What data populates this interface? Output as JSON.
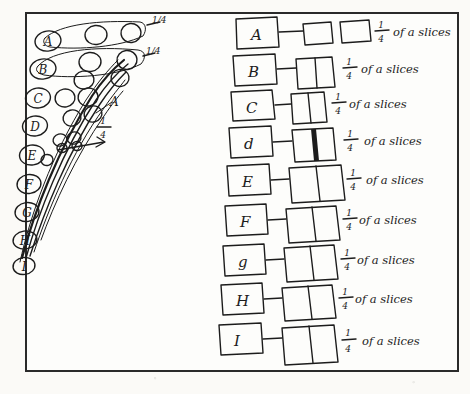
{
  "document": {
    "kind": "handwritten-worksheet-scan",
    "page_background": "#fbfaf7",
    "ink_color": "#1c1c1c",
    "frame_color": "#2a2a2a"
  },
  "left_diagram": {
    "name": "oval-chain-diagram",
    "annotations": [
      {
        "id": "top-mark-1",
        "text": "1/4"
      },
      {
        "id": "top-mark-2",
        "text": "1/4"
      },
      {
        "id": "mid-mark",
        "text": "1/4"
      },
      {
        "id": "mid-label",
        "text": "A"
      }
    ],
    "oval_labels": [
      "A",
      "B",
      "C",
      "D",
      "E",
      "F",
      "G",
      "H",
      "I"
    ]
  },
  "right_list": {
    "name": "labelled-slice-rows",
    "phrase": "of a slices",
    "rows": [
      {
        "label": "A",
        "fraction_numerator": "1",
        "fraction_denominator": "4",
        "text": "of a slices",
        "boxes": 2,
        "box_style": "separate",
        "shaded": 0
      },
      {
        "label": "B",
        "fraction_numerator": "1",
        "fraction_denominator": "4",
        "text": "of a slices",
        "boxes": 2,
        "box_style": "joined",
        "shaded": 0
      },
      {
        "label": "C",
        "fraction_numerator": "1",
        "fraction_denominator": "4",
        "text": "of a slices",
        "boxes": 2,
        "box_style": "joined",
        "shaded": 0
      },
      {
        "label": "d",
        "fraction_numerator": "1",
        "fraction_denominator": "4",
        "text": "of a slices",
        "boxes": 2,
        "box_style": "joined",
        "shaded": 1
      },
      {
        "label": "E",
        "fraction_numerator": "1",
        "fraction_denominator": "4",
        "text": "of a slices",
        "boxes": 2,
        "box_style": "joined",
        "shaded": 0
      },
      {
        "label": "F",
        "fraction_numerator": "1",
        "fraction_denominator": "4",
        "text": "of a slices",
        "boxes": 2,
        "box_style": "joined",
        "shaded": 0
      },
      {
        "label": "g",
        "fraction_numerator": "1",
        "fraction_denominator": "4",
        "text": "of a slices",
        "boxes": 2,
        "box_style": "joined",
        "shaded": 0
      },
      {
        "label": "H",
        "fraction_numerator": "1",
        "fraction_denominator": "4",
        "text": "of a slices",
        "boxes": 2,
        "box_style": "joined",
        "shaded": 0
      },
      {
        "label": "I",
        "fraction_numerator": "1",
        "fraction_denominator": "4",
        "text": "of a slices",
        "boxes": 2,
        "box_style": "joined",
        "shaded": 0
      }
    ]
  }
}
